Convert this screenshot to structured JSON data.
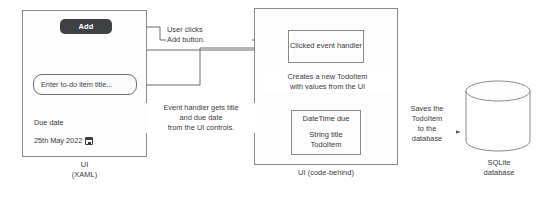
{
  "diagram": {
    "panels": {
      "xaml": {
        "caption": "UI\n(XAML)",
        "add_button_label": "Add",
        "title_input_value": "Enter to-do item title...",
        "due_date_label": "Due date",
        "date_value": "25th May 2022",
        "calendar_icon": "calendar-icon"
      },
      "code_behind": {
        "caption": "UI (code-behind)",
        "handler_box": "Clicked event\nhandler",
        "todoitem_box_lines": [
          "DateTime due",
          "String title",
          "TodoItem"
        ]
      },
      "database": {
        "caption": "SQLite\ndatabase",
        "shape": "cylinder-icon"
      }
    },
    "edges": {
      "user_clicks": "User clicks\nAdd button.",
      "creates_new": "Creates a new TodoItem\nwith values from the UI",
      "event_handler_gets": "Event handler gets title\nand due date\nfrom the UI controls.",
      "saves_to_db": "Saves the\nTodoItem\nto the\ndatabase"
    },
    "colors": {
      "stroke": "#8a8a8a",
      "line": "#6b6b6b",
      "text": "#3b3b3b",
      "button_bg": "#3f4145",
      "button_fg": "#ffffff",
      "page_bg": "#ffffff"
    }
  }
}
